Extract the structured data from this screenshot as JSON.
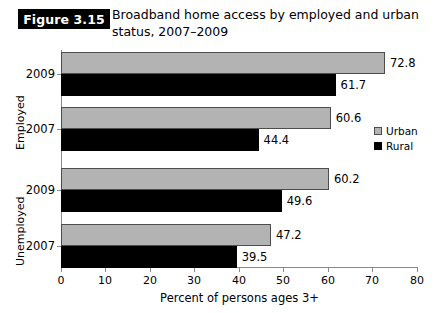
{
  "figure": {
    "badge": "Figure 3.15",
    "title_line1": "Broadband home access by employed and urban",
    "title_line2": "status, 2007–2009"
  },
  "legend": {
    "position": "right",
    "items": [
      {
        "label": "Urban",
        "color": "#b3b3b3",
        "icon": "square-swatch-icon"
      },
      {
        "label": "Rural",
        "color": "#000000",
        "icon": "square-swatch-icon"
      }
    ]
  },
  "axis": {
    "x_label": "Percent of persons ages 3+",
    "x_ticks": [
      "0",
      "10",
      "20",
      "30",
      "40",
      "50",
      "60",
      "70",
      "80"
    ]
  },
  "groups": [
    {
      "name": "Employed",
      "years": [
        "2009",
        "2007"
      ]
    },
    {
      "name": "Unemployed",
      "years": [
        "2009",
        "2007"
      ]
    }
  ],
  "bars": [
    {
      "group": "Employed",
      "year": "2009",
      "series": "Urban",
      "value": 72.8,
      "label": "72.8"
    },
    {
      "group": "Employed",
      "year": "2009",
      "series": "Rural",
      "value": 61.7,
      "label": "61.7"
    },
    {
      "group": "Employed",
      "year": "2007",
      "series": "Urban",
      "value": 60.6,
      "label": "60.6"
    },
    {
      "group": "Employed",
      "year": "2007",
      "series": "Rural",
      "value": 44.4,
      "label": "44.4"
    },
    {
      "group": "Unemployed",
      "year": "2009",
      "series": "Urban",
      "value": 60.2,
      "label": "60.2"
    },
    {
      "group": "Unemployed",
      "year": "2009",
      "series": "Rural",
      "value": 49.6,
      "label": "49.6"
    },
    {
      "group": "Unemployed",
      "year": "2007",
      "series": "Urban",
      "value": 47.2,
      "label": "47.2"
    },
    {
      "group": "Unemployed",
      "year": "2007",
      "series": "Rural",
      "value": 39.5,
      "label": "39.5"
    }
  ],
  "chart_data": {
    "type": "bar",
    "orientation": "horizontal",
    "title": "Broadband home access by employed and urban status, 2007–2009",
    "subtitle": "",
    "xlabel": "Percent of persons ages 3+",
    "ylabel": "",
    "xlim": [
      0,
      80
    ],
    "xticks": [
      0,
      10,
      20,
      30,
      40,
      50,
      60,
      70,
      80
    ],
    "grid": false,
    "legend_position": "right",
    "categories": [
      "Employed 2009",
      "Employed 2007",
      "Unemployed 2009",
      "Unemployed 2007"
    ],
    "series": [
      {
        "name": "Urban",
        "color": "#b3b3b3",
        "values": [
          72.8,
          60.6,
          60.2,
          47.2
        ]
      },
      {
        "name": "Rural",
        "color": "#000000",
        "values": [
          61.7,
          44.4,
          49.6,
          39.5
        ]
      }
    ]
  }
}
